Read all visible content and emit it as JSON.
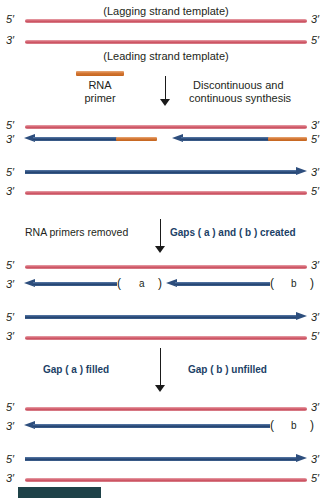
{
  "figure": {
    "title_top": "(Lagging strand template)",
    "title_mid": "(Leading strand template)",
    "primer_label_line1": "RNA",
    "primer_label_line2": "primer",
    "synthesis_label_line1": "Discontinuous and",
    "synthesis_label_line2": "continuous synthesis",
    "step2_left_label": "RNA primers removed",
    "step2_right_label": "Gaps (   a   ) and (   b   ) created",
    "step3_left_label": "Gap (   a   ) filled",
    "step3_right_label": "Gap (   b   ) unfilled",
    "gap_a_open": "(",
    "gap_a_letter": "a",
    "gap_a_close": ")",
    "gap_b_open": "(",
    "gap_b_letter": "b",
    "gap_b_close": ")",
    "ends": {
      "five": "5′",
      "three": "3′"
    },
    "colors": {
      "template_strand": "#d4606f",
      "rna_primer": "#d2732f",
      "dna_strand": "#2d4e7d",
      "label_blue": "#1c3f66",
      "footer_bar": "#1e4248",
      "text": "#231f20",
      "background": "#ffffff"
    }
  },
  "panels": [
    {
      "name": "panel-1-parental-duplex",
      "strands": [
        {
          "type": "template",
          "left_end": "5′",
          "right_end": "3′",
          "role": "lagging-strand-template"
        },
        {
          "type": "template",
          "left_end": "3′",
          "right_end": "5′",
          "role": "leading-strand-template"
        }
      ]
    },
    {
      "name": "panel-2-synthesis",
      "strands": [
        {
          "type": "template",
          "left_end": "5′",
          "right_end": "3′",
          "role": "lagging-strand-template"
        },
        {
          "type": "okazaki-fragments",
          "left_end": "3′",
          "right_end": "5′",
          "fragments": 2,
          "role": "lagging-strand-nascent"
        },
        {
          "type": "dna-arrow",
          "left_end": "5′",
          "right_end": "3′",
          "role": "leading-strand-nascent"
        },
        {
          "type": "template",
          "left_end": "3′",
          "right_end": "5′",
          "role": "leading-strand-template"
        }
      ]
    },
    {
      "name": "panel-3-primers-removed",
      "strands": [
        {
          "type": "template",
          "left_end": "5′",
          "right_end": "3′",
          "role": "lagging-strand-template"
        },
        {
          "type": "dna-with-gaps",
          "left_end": "3′",
          "gaps": [
            "a",
            "b"
          ],
          "role": "lagging-strand-nascent"
        },
        {
          "type": "dna-arrow",
          "left_end": "5′",
          "right_end": "3′",
          "role": "leading-strand-nascent"
        },
        {
          "type": "template",
          "left_end": "3′",
          "right_end": "5′",
          "role": "leading-strand-template"
        }
      ]
    },
    {
      "name": "panel-4-gap-a-filled",
      "strands": [
        {
          "type": "template",
          "left_end": "5′",
          "right_end": "3′",
          "role": "lagging-strand-template"
        },
        {
          "type": "dna-with-gaps",
          "left_end": "3′",
          "gaps": [
            "b"
          ],
          "role": "lagging-strand-nascent"
        },
        {
          "type": "dna-arrow",
          "left_end": "5′",
          "right_end": "3′",
          "role": "leading-strand-nascent"
        },
        {
          "type": "template",
          "left_end": "3′",
          "right_end": "5′",
          "role": "leading-strand-template"
        }
      ]
    }
  ]
}
